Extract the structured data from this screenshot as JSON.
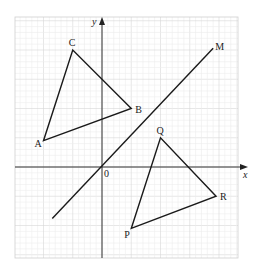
{
  "diagram": {
    "title": "",
    "type": "coordinate-geometry-reflection",
    "axes": {
      "x_label": "x",
      "y_label": "y",
      "origin_label": "0"
    },
    "grid": {
      "minor_unit_px": 5.85,
      "major_every": 5,
      "x_range": [
        -15,
        23
      ],
      "y_range": [
        -15,
        26
      ]
    },
    "colors": {
      "minor_grid": "#ececec",
      "major_grid": "#d6d6d6",
      "lines": "#1a1a1a",
      "border": "#cfcfcf"
    },
    "mirror_line": {
      "label": "M",
      "equation": "y = x",
      "from": [
        -8.5,
        -8.8
      ],
      "to": [
        19,
        20.3
      ]
    },
    "triangles": [
      {
        "name": "ABC",
        "vertices": [
          {
            "label": "A",
            "x": -10,
            "y": 4.5
          },
          {
            "label": "B",
            "x": 5,
            "y": 10
          },
          {
            "label": "C",
            "x": -5,
            "y": 20
          }
        ]
      },
      {
        "name": "PQR",
        "vertices": [
          {
            "label": "P",
            "x": 5,
            "y": -10.5
          },
          {
            "label": "Q",
            "x": 10,
            "y": 5
          },
          {
            "label": "R",
            "x": 19.5,
            "y": -5
          }
        ]
      }
    ]
  }
}
